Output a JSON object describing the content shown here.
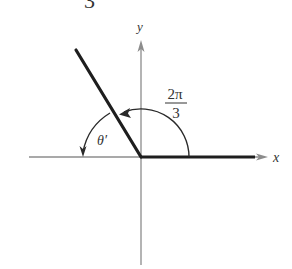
{
  "figure": {
    "type": "reference-angle-diagram",
    "top_partial_text": "3",
    "axes": {
      "x_label": "x",
      "y_label": "y",
      "axis_color": "#8c8c8c"
    },
    "angle": {
      "numerator": "2π",
      "denominator": "3",
      "reference_angle_label": "θ′"
    },
    "colors": {
      "terminal_side": "#1e1e1e",
      "arc": "#2a2a2a",
      "text": "#333333"
    }
  }
}
